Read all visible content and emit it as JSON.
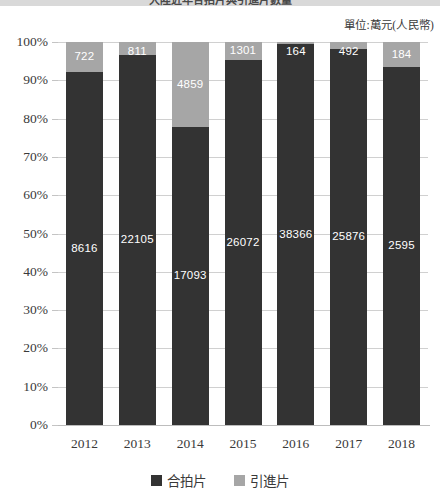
{
  "title": "大陸近年合拍片與引進片數量",
  "unit_label": "單位:萬元(人民幣)",
  "legend": {
    "items": [
      {
        "label": "合拍片",
        "color": "#333333",
        "key": "coproduction"
      },
      {
        "label": "引進片",
        "color": "#a6a6a6",
        "key": "imported"
      }
    ]
  },
  "axes": {
    "y_ticks": [
      "100%",
      "90%",
      "80%",
      "70%",
      "60%",
      "50%",
      "40%",
      "30%",
      "20%",
      "10%",
      "0%"
    ],
    "x_ticks": [
      "2012",
      "2013",
      "2014",
      "2015",
      "2016",
      "2017",
      "2018"
    ]
  },
  "chart_data": {
    "type": "bar",
    "title": "大陸近年合拍片與引進片數量",
    "subtitle": "單位:萬元(人民幣)",
    "xlabel": "",
    "ylabel": "",
    "ylim": [
      0,
      100
    ],
    "stacked": true,
    "normalized_percent": true,
    "grid": true,
    "legend_position": "bottom",
    "categories": [
      "2012",
      "2013",
      "2014",
      "2015",
      "2016",
      "2017",
      "2018"
    ],
    "series": [
      {
        "name": "合拍片",
        "color": "#333333",
        "values": [
          8616,
          22105,
          17093,
          26072,
          38366,
          25876,
          2595
        ],
        "percents": [
          92.3,
          96.5,
          77.9,
          95.2,
          99.6,
          98.1,
          93.4
        ]
      },
      {
        "name": "引進片",
        "color": "#a6a6a6",
        "values": [
          722,
          811,
          4859,
          1301,
          164,
          492,
          184
        ],
        "percents": [
          7.7,
          3.5,
          22.1,
          4.8,
          0.4,
          1.9,
          6.6
        ]
      }
    ],
    "bar_labels": {
      "合拍片": [
        "8616",
        "22105",
        "17093",
        "26072",
        "38366",
        "25876",
        "2595"
      ],
      "引進片": [
        "722",
        "811",
        "4859",
        "1301",
        "164",
        "492",
        "184"
      ]
    }
  }
}
